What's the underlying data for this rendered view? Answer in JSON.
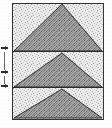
{
  "figure": {
    "plate": {
      "border_color": "#333333",
      "background_fill": "#e9e9e9",
      "background_label": "light stipple",
      "x": 12,
      "y": 3,
      "width": 92,
      "height": 117
    },
    "triangles": [
      {
        "index": 1,
        "name": "top-triangle",
        "apex_x": 50,
        "apex_y": 1,
        "base_y": 48,
        "base_left_x": 1,
        "base_right_x": 91,
        "fill_color": "#9a9a9a",
        "fill_label": "dark stipple",
        "outline_color": "#2a2a2a"
      },
      {
        "index": 2,
        "name": "middle-triangle",
        "apex_x": 50,
        "apex_y": 49,
        "base_y": 84,
        "base_left_x": 1,
        "base_right_x": 91,
        "fill_color": "#9a9a9a",
        "fill_label": "dark stipple",
        "outline_color": "#2a2a2a"
      },
      {
        "index": 3,
        "name": "bottom-triangle",
        "apex_x": 50,
        "apex_y": 85,
        "base_y": 115,
        "base_left_x": 1,
        "base_right_x": 91,
        "fill_color": "#9a9a9a",
        "fill_label": "dark stipple",
        "outline_color": "#2a2a2a"
      }
    ],
    "divider_rules": [
      {
        "index": 1,
        "name": "upper-divider",
        "y": 48,
        "color": "#2a2a2a"
      },
      {
        "index": 2,
        "name": "lower-divider",
        "y": 84,
        "color": "#2a2a2a"
      }
    ],
    "margin_marks": [
      {
        "index": 1,
        "name": "margin-mark-upper",
        "y": 48,
        "color": "#2b2b2b"
      },
      {
        "index": 2,
        "name": "margin-mark-middle",
        "y": 72,
        "color": "#2b2b2b"
      },
      {
        "index": 3,
        "name": "margin-mark-lower",
        "y": 86,
        "color": "#2b2b2b"
      }
    ],
    "margin_rules": [
      {
        "index": 1,
        "name": "margin-rule-upper",
        "y": 52,
        "height": 18,
        "color": "#6a6a6a"
      },
      {
        "index": 2,
        "name": "margin-rule-lower",
        "y": 76,
        "height": 8,
        "color": "#6a6a6a"
      }
    ]
  }
}
